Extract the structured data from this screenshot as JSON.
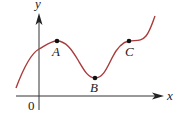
{
  "diagram": {
    "type": "function-graph",
    "axes": {
      "x_label": "x",
      "y_label": "y",
      "origin_label": "0"
    },
    "curve_color": "#a83a3a",
    "axis_color": "#333333",
    "points": [
      {
        "label": "A",
        "description": "local maximum"
      },
      {
        "label": "B",
        "description": "local minimum"
      },
      {
        "label": "C",
        "description": "horizontal inflection point"
      }
    ]
  }
}
